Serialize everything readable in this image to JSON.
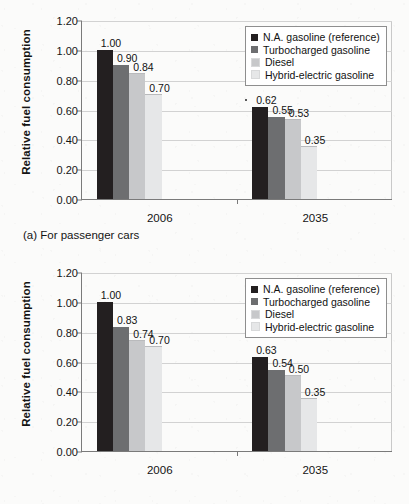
{
  "figure": {
    "panels": [
      {
        "caption": "(a) For passenger cars",
        "chart_data": {
          "type": "bar",
          "title": "",
          "subtitle": "",
          "xlabel": "",
          "ylabel": "Relative fuel consumption",
          "categories": [
            "2006",
            "2035"
          ],
          "ylim": [
            0.0,
            1.2
          ],
          "yticks": [
            "0.00",
            "0.20",
            "0.40",
            "0.60",
            "0.80",
            "1.00",
            "1.20"
          ],
          "grid": true,
          "legend_position": "top-right",
          "series": [
            {
              "name": "N.A. gasoline (reference)",
              "color": "#231f20",
              "values": [
                1.0,
                0.62
              ],
              "labels": [
                "1.00",
                "0.62"
              ]
            },
            {
              "name": "Turbocharged gasoline",
              "color": "#6d6e70",
              "values": [
                0.9,
                0.55
              ],
              "labels": [
                "0.90",
                "0.55"
              ]
            },
            {
              "name": "Diesel",
              "color": "#c7c8ca",
              "values": [
                0.84,
                0.53
              ],
              "labels": [
                "0.84",
                "0.53"
              ]
            },
            {
              "name": "Hybrid-electric gasoline",
              "color": "#e6e7e8",
              "values": [
                0.7,
                0.35
              ],
              "labels": [
                "0.70",
                "0.35"
              ]
            }
          ]
        }
      },
      {
        "caption": "(b) For light trucks",
        "chart_data": {
          "type": "bar",
          "title": "",
          "subtitle": "",
          "xlabel": "",
          "ylabel": "Relative fuel consumption",
          "categories": [
            "2006",
            "2035"
          ],
          "ylim": [
            0.0,
            1.2
          ],
          "yticks": [
            "0.00",
            "0.20",
            "0.40",
            "0.60",
            "0.80",
            "1.00",
            "1.20"
          ],
          "grid": true,
          "legend_position": "top-right",
          "series": [
            {
              "name": "N.A. gasoline (reference)",
              "color": "#231f20",
              "values": [
                1.0,
                0.63
              ],
              "labels": [
                "1.00",
                "0.63"
              ]
            },
            {
              "name": "Turbocharged gasoline",
              "color": "#6d6e70",
              "values": [
                0.83,
                0.54
              ],
              "labels": [
                "0.83",
                "0.54"
              ]
            },
            {
              "name": "Diesel",
              "color": "#c7c8ca",
              "values": [
                0.74,
                0.5
              ],
              "labels": [
                "0.74",
                "0.50"
              ]
            },
            {
              "name": "Hybrid-electric gasoline",
              "color": "#e6e7e8",
              "values": [
                0.7,
                0.35
              ],
              "labels": [
                "0.70",
                "0.35"
              ]
            }
          ]
        }
      }
    ]
  }
}
